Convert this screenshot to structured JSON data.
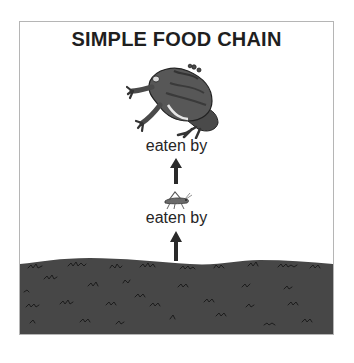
{
  "diagram": {
    "title": "SIMPLE FOOD CHAIN",
    "chain": [
      {
        "role": "consumer-top",
        "organism": "frog",
        "icon": "frog-icon"
      },
      {
        "relation": "eaten by",
        "arrow": "up-arrow-icon"
      },
      {
        "role": "consumer-primary",
        "organism": "grasshopper",
        "icon": "grasshopper-icon"
      },
      {
        "relation": "eaten by",
        "arrow": "up-arrow-icon"
      },
      {
        "role": "producer",
        "organism": "grass",
        "icon": "grass-ground-icon"
      }
    ],
    "labels": {
      "upper": "eaten by",
      "lower": "eaten by"
    },
    "colors": {
      "border": "#b5b5b5",
      "text": "#1f1f1f",
      "ground": "#474747",
      "grass_tufts": "#1c1c1c",
      "frog_body": "#555555",
      "arrow": "#2a2a2a"
    }
  }
}
